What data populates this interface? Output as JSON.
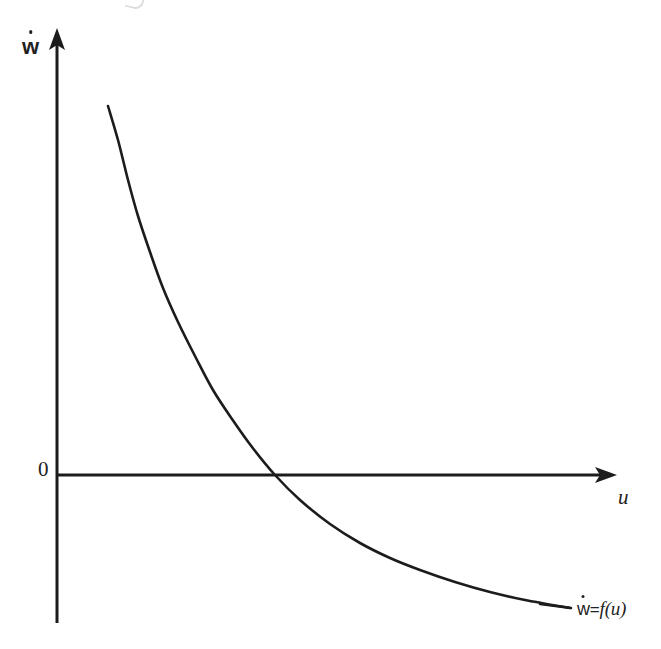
{
  "figure": {
    "background_color": "#ffffff",
    "ink_color": "#1c1c1c",
    "y_axis_label": "ẇ",
    "x_axis_label": "u",
    "origin_label": "0",
    "curve_label_parts": {
      "lhs_base": "w",
      "equals": "=",
      "function_name": "f",
      "open_paren": "(",
      "argument": "u",
      "close_paren": ")"
    },
    "curve_label_text": "ẇ = f(u)"
  },
  "chart_data": {
    "type": "line",
    "title": "",
    "subtitle": "",
    "xlabel": "u",
    "ylabel": "ẇ",
    "legend": [
      "ẇ = f(u)"
    ],
    "legend_position": "end-of-curve",
    "grid": false,
    "axes": {
      "x_axis_kind": "arrow",
      "y_axis_kind": "arrow",
      "origin_label": "0",
      "x_origin_px": 57,
      "y_origin_px": 475,
      "x_axis_end_px": 616,
      "y_axis_top_px": 29,
      "y_axis_bottom_px": 623,
      "xlim_px": [
        57,
        616
      ],
      "ylim_px": [
        29,
        623
      ],
      "ticks_x": [],
      "ticks_y": [],
      "tick_labels_x": [],
      "tick_labels_y": [
        "0"
      ]
    },
    "annotations": [
      {
        "text": "ẇ = f(u)",
        "x_px": 577,
        "y_px": 611,
        "role": "curve-label"
      }
    ],
    "series": [
      {
        "name": "ẇ = f(u)",
        "description": "monotonically decreasing convex curve, positive for small u, crossing zero and approaching a negative asymptote",
        "color": "#1c1c1c",
        "zero_crossing_px": [
          275,
          475
        ],
        "points_px": [
          [
            108,
            106
          ],
          [
            118,
            140
          ],
          [
            128,
            180
          ],
          [
            138,
            216
          ],
          [
            150,
            252
          ],
          [
            163,
            288
          ],
          [
            178,
            322
          ],
          [
            196,
            358
          ],
          [
            213,
            390
          ],
          [
            232,
            419
          ],
          [
            252,
            447
          ],
          [
            275,
            475
          ],
          [
            300,
            500
          ],
          [
            330,
            524
          ],
          [
            360,
            543
          ],
          [
            390,
            558
          ],
          [
            420,
            570
          ],
          [
            455,
            582
          ],
          [
            490,
            592
          ],
          [
            525,
            600
          ],
          [
            570,
            608
          ]
        ]
      }
    ]
  }
}
